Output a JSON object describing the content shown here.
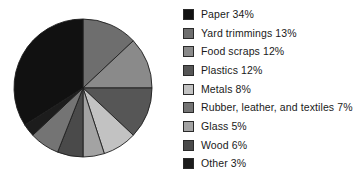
{
  "chart_data": {
    "type": "pie",
    "title": "",
    "subtitle": "",
    "xlabel": "",
    "ylabel": "",
    "legend_position": "right",
    "grid": false,
    "units": "percent",
    "start_angle_deg": 0,
    "direction": "clockwise",
    "categories": [
      "Paper",
      "Yard trimmings",
      "Food scraps",
      "Plastics",
      "Metals",
      "Rubber, leather, and textiles",
      "Glass",
      "Wood",
      "Other"
    ],
    "values": [
      34,
      13,
      12,
      12,
      8,
      7,
      5,
      6,
      3
    ],
    "colors": [
      "#111111",
      "#6e6e6e",
      "#8a8a8a",
      "#565656",
      "#c2c2c2",
      "#747474",
      "#a3a3a3",
      "#4a4a4a",
      "#1c1c1c"
    ],
    "slice_order_clockwise_from_top": [
      "Yard trimmings",
      "Food scraps",
      "Plastics",
      "Metals",
      "Glass",
      "Wood",
      "Rubber, leather, and textiles",
      "Other",
      "Paper"
    ],
    "stroke_color": "#1e1e1e",
    "background": "#ffffff"
  },
  "legend": {
    "items": [
      {
        "label": "Paper 34%",
        "name": "Paper",
        "value": 34,
        "color": "#111111"
      },
      {
        "label": "Yard trimmings 13%",
        "name": "Yard trimmings",
        "value": 13,
        "color": "#6e6e6e"
      },
      {
        "label": "Food scraps 12%",
        "name": "Food scraps",
        "value": 12,
        "color": "#8a8a8a"
      },
      {
        "label": "Plastics 12%",
        "name": "Plastics",
        "value": 12,
        "color": "#565656"
      },
      {
        "label": "Metals 8%",
        "name": "Metals",
        "value": 8,
        "color": "#c2c2c2"
      },
      {
        "label": "Rubber, leather, and textiles 7%",
        "name": "Rubber, leather, and textiles",
        "value": 7,
        "color": "#747474"
      },
      {
        "label": "Glass 5%",
        "name": "Glass",
        "value": 5,
        "color": "#a3a3a3"
      },
      {
        "label": "Wood 6%",
        "name": "Wood",
        "value": 6,
        "color": "#4a4a4a"
      },
      {
        "label": "Other 3%",
        "name": "Other",
        "value": 3,
        "color": "#1c1c1c"
      }
    ]
  },
  "geometry": {
    "center_x": 83,
    "center_y": 88,
    "radius": 69
  }
}
